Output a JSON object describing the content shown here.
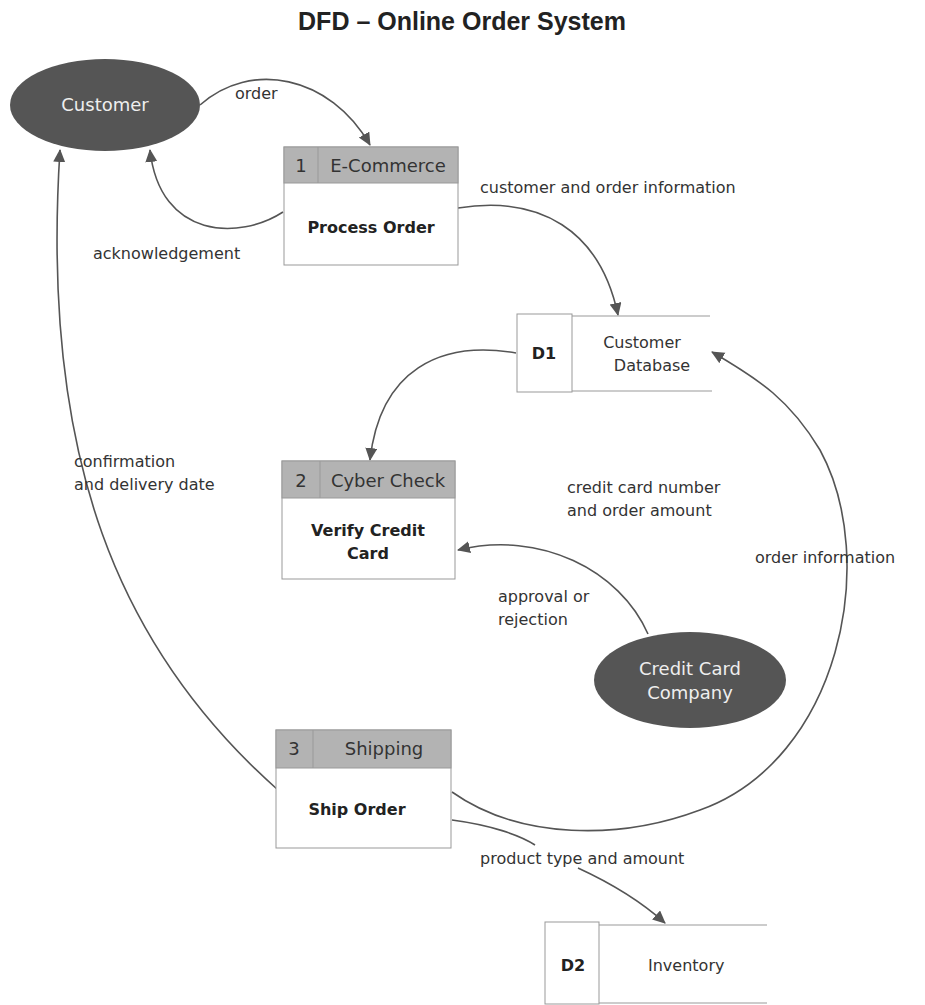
{
  "title": "DFD – Online Order System",
  "external_entities": [
    {
      "id": "customer",
      "label": "Customer"
    },
    {
      "id": "credit-card-company",
      "label_lines": [
        "Credit Card",
        "Company"
      ]
    }
  ],
  "processes": [
    {
      "number": "1",
      "owner": "E-Commerce",
      "name_lines": [
        "Process Order"
      ]
    },
    {
      "number": "2",
      "owner": "Cyber Check",
      "name_lines": [
        "Verify Credit",
        "Card"
      ]
    },
    {
      "number": "3",
      "owner": "Shipping",
      "name_lines": [
        "Ship Order"
      ]
    }
  ],
  "data_stores": [
    {
      "id": "D1",
      "name_lines": [
        "Customer",
        "Database"
      ]
    },
    {
      "id": "D2",
      "name_lines": [
        "Inventory"
      ]
    }
  ],
  "flows": [
    {
      "from": "Customer",
      "to": "Process Order",
      "label_lines": [
        "order"
      ]
    },
    {
      "from": "Process Order",
      "to": "Customer",
      "label_lines": [
        "acknowledgement"
      ]
    },
    {
      "from": "Process Order",
      "to": "D1 Customer Database",
      "label_lines": [
        "customer and order information"
      ]
    },
    {
      "from": "D1 Customer Database",
      "to": "Verify Credit Card",
      "label_lines": [
        "credit card number",
        "and order amount"
      ]
    },
    {
      "from": "Credit Card Company",
      "to": "Verify Credit Card",
      "label_lines": [
        "approval or",
        "rejection"
      ]
    },
    {
      "from": "Ship Order",
      "to": "D1 Customer Database",
      "label_lines": [
        "order information"
      ]
    },
    {
      "from": "Ship Order",
      "to": "Customer",
      "label_lines": [
        "confirmation",
        "and delivery date"
      ]
    },
    {
      "from": "Ship Order",
      "to": "D2 Inventory",
      "label_lines": [
        "product type and amount"
      ]
    }
  ],
  "colors": {
    "entity_fill": "#555555",
    "header_fill": "#b3b3b3",
    "line": "#555555",
    "background": "#ffffff"
  }
}
